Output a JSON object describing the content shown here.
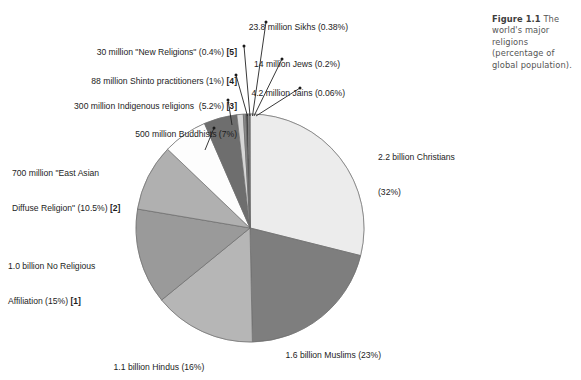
{
  "figure": {
    "caption_label": "Figure 1.1",
    "caption_text": " The world's major religions (percentage of global population)."
  },
  "chart_data": {
    "type": "pie",
    "title": "Figure 1.1 The world's major religions (percentage of global population).",
    "subtitle": "",
    "xlabel": "",
    "ylabel": "",
    "legend_position": "callout-labels",
    "grid": false,
    "start_angle_deg": -90,
    "direction": "clockwise",
    "units": "percentage of global population",
    "categories": [
      "Christians",
      "Muslims",
      "Hindus",
      "No Religious Affiliation",
      "East Asian Diffuse Religion",
      "Buddhists",
      "Indigenous religions",
      "Shinto practitioners",
      "New Religions",
      "Sikhs",
      "Jews",
      "Jains"
    ],
    "values": [
      32,
      23,
      16,
      15,
      10.5,
      7,
      5.2,
      1,
      0.4,
      0.38,
      0.2,
      0.06
    ],
    "colors": [
      "#ececec",
      "#7e7e7e",
      "#b6b6b6",
      "#9a9a9a",
      "#b0b0b0",
      "#fdfdfd",
      "#6e6e6e",
      "#d6d6d6",
      "#8a8a8a",
      "#474747",
      "#cfcfcf",
      "#777777"
    ],
    "slices": [
      {
        "name": "Christians",
        "adherents": "2.2 billion",
        "percent": 32,
        "label_line1": "2.2 billion Christians",
        "label_line2": "(32%)",
        "footnote": "",
        "color": "#ececec"
      },
      {
        "name": "Muslims",
        "adherents": "1.6 billion",
        "percent": 23,
        "label_line1": "1.6 billion Muslims (23%)",
        "label_line2": "",
        "footnote": "",
        "color": "#7e7e7e"
      },
      {
        "name": "Hindus",
        "adherents": "1.1 billion",
        "percent": 16,
        "label_line1": "1.1 billion Hindus (16%)",
        "label_line2": "",
        "footnote": "",
        "color": "#b6b6b6"
      },
      {
        "name": "No Religious Affiliation",
        "adherents": "1.0 billion",
        "percent": 15,
        "label_line1": "1.0 billion No Religious",
        "label_line2": "Affiliation (15%) ",
        "footnote": "[1]",
        "color": "#9a9a9a"
      },
      {
        "name": "East Asian Diffuse Religion",
        "adherents": "700 million",
        "percent": 10.5,
        "label_line1": "700 million \"East Asian",
        "label_line2": "Diffuse Religion\" (10.5%) ",
        "footnote": "[2]",
        "color": "#b0b0b0"
      },
      {
        "name": "Buddhists",
        "adherents": "500 million",
        "percent": 7,
        "label_line1": "500 million Buddhists (7%)",
        "label_line2": "",
        "footnote": "",
        "color": "#fdfdfd"
      },
      {
        "name": "Indigenous religions",
        "adherents": "300 million",
        "percent": 5.2,
        "label_line1": "300 million Indigenous religions  (5.2%) ",
        "label_line2": "",
        "footnote": "[3]",
        "color": "#6e6e6e"
      },
      {
        "name": "Shinto practitioners",
        "adherents": "88 million",
        "percent": 1,
        "label_line1": "88 million Shinto practitioners (1%) ",
        "label_line2": "",
        "footnote": "[4]",
        "color": "#d6d6d6"
      },
      {
        "name": "New Religions",
        "adherents": "30 million",
        "percent": 0.4,
        "label_line1": "30 million \"New Religions\" (0.4%) ",
        "label_line2": "",
        "footnote": "[5]",
        "color": "#8a8a8a"
      },
      {
        "name": "Sikhs",
        "adherents": "23.8 million",
        "percent": 0.38,
        "label_line1": "23.8 million Sikhs (0.38%)",
        "label_line2": "",
        "footnote": "",
        "color": "#474747"
      },
      {
        "name": "Jews",
        "adherents": "14 million",
        "percent": 0.2,
        "label_line1": "14 million Jews (0.2%)",
        "label_line2": "",
        "footnote": "",
        "color": "#cfcfcf"
      },
      {
        "name": "Jains",
        "adherents": "4.2 million",
        "percent": 0.06,
        "label_line1": "4.2 million Jains (0.06%)",
        "label_line2": "",
        "footnote": "",
        "color": "#777777"
      }
    ]
  },
  "geometry": {
    "center_x": 250,
    "center_y": 228,
    "radius": 114
  },
  "leaders": [
    {
      "name": "sikhs",
      "x1": 266,
      "y1": 22,
      "x2": 252.5,
      "y2": 116
    },
    {
      "name": "new",
      "x1": 244,
      "y1": 46,
      "x2": 250.0,
      "y2": 116
    },
    {
      "name": "jews",
      "x1": 282,
      "y1": 59,
      "x2": 254.0,
      "y2": 116
    },
    {
      "name": "shinto",
      "x1": 236,
      "y1": 75,
      "x2": 247.5,
      "y2": 116
    },
    {
      "name": "jains",
      "x1": 300,
      "y1": 88,
      "x2": 256.0,
      "y2": 116
    },
    {
      "name": "indig",
      "x1": 228,
      "y1": 100,
      "x2": 232.0,
      "y2": 125
    },
    {
      "name": "buddhists",
      "x1": 214,
      "y1": 128,
      "x2": 205.0,
      "y2": 150
    }
  ]
}
